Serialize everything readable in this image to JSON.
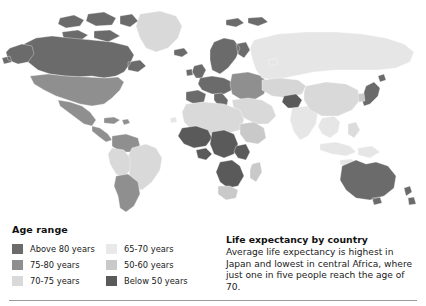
{
  "legend": {
    "title": "Age range",
    "items_left": [
      {
        "label": "Above 80 years",
        "color": "#6b6b6b"
      },
      {
        "label": "75-80 years",
        "color": "#8f8f8f"
      },
      {
        "label": "70-75 years",
        "color": "#d9d9d9"
      }
    ],
    "items_right": [
      {
        "label": "65-70 years",
        "color": "#e6e6e6"
      },
      {
        "label": "50-60 years",
        "color": "#c9c9c9"
      },
      {
        "label": "Below 50 years",
        "color": "#5a5a5a"
      }
    ]
  },
  "caption": {
    "title": "Life expectancy by country",
    "body": "Average life expectancy is highest in Japan and lowest in central Africa, where just one in five people reach the age of 70."
  },
  "map": {
    "name": "world-choropleth-life-expectancy",
    "ocean_color": "#ffffff",
    "border_color": "#ffffff",
    "palette": {
      "above_80": "#6b6b6b",
      "75_80": "#8f8f8f",
      "70_75": "#d9d9d9",
      "65_70": "#e6e6e6",
      "50_60": "#c9c9c9",
      "below_50": "#5a5a5a",
      "no_data": "#ededed"
    },
    "regions": [
      {
        "name": "greenland",
        "bucket": "70_75"
      },
      {
        "name": "canada",
        "bucket": "above_80"
      },
      {
        "name": "alaska",
        "bucket": "above_80"
      },
      {
        "name": "united-states",
        "bucket": "75_80"
      },
      {
        "name": "mexico",
        "bucket": "75_80"
      },
      {
        "name": "central-america",
        "bucket": "75_80"
      },
      {
        "name": "caribbean",
        "bucket": "75_80"
      },
      {
        "name": "colombia-venezuela",
        "bucket": "75_80"
      },
      {
        "name": "brazil",
        "bucket": "70_75"
      },
      {
        "name": "peru-bolivia",
        "bucket": "70_75"
      },
      {
        "name": "chile-argentina",
        "bucket": "75_80"
      },
      {
        "name": "iceland",
        "bucket": "above_80"
      },
      {
        "name": "uk-ireland",
        "bucket": "above_80"
      },
      {
        "name": "scandinavia",
        "bucket": "above_80"
      },
      {
        "name": "western-europe",
        "bucket": "above_80"
      },
      {
        "name": "italy-spain",
        "bucket": "above_80"
      },
      {
        "name": "eastern-europe",
        "bucket": "75_80"
      },
      {
        "name": "russia",
        "bucket": "65_70"
      },
      {
        "name": "north-africa",
        "bucket": "70_75"
      },
      {
        "name": "west-africa",
        "bucket": "below_50"
      },
      {
        "name": "central-africa",
        "bucket": "below_50"
      },
      {
        "name": "horn-of-africa",
        "bucket": "50_60"
      },
      {
        "name": "southern-africa",
        "bucket": "below_50"
      },
      {
        "name": "south-africa",
        "bucket": "50_60"
      },
      {
        "name": "middle-east",
        "bucket": "70_75"
      },
      {
        "name": "afghanistan",
        "bucket": "below_50"
      },
      {
        "name": "india",
        "bucket": "65_70"
      },
      {
        "name": "china",
        "bucket": "70_75"
      },
      {
        "name": "southeast-asia",
        "bucket": "65_70"
      },
      {
        "name": "indonesia",
        "bucket": "65_70"
      },
      {
        "name": "japan",
        "bucket": "above_80"
      },
      {
        "name": "australia",
        "bucket": "above_80"
      },
      {
        "name": "new-zealand",
        "bucket": "above_80"
      }
    ]
  }
}
